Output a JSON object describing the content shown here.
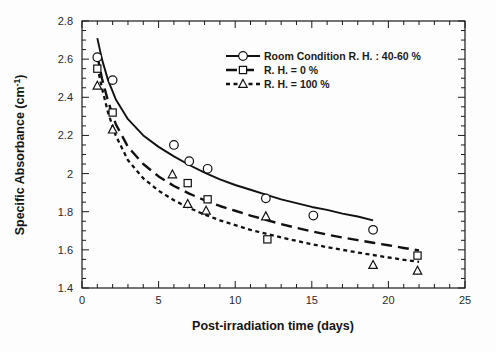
{
  "chart_data": {
    "type": "scatter",
    "title": "",
    "xlabel": "Post-irradiation time (days)",
    "ylabel": "Specific Absorbance (cm-1)",
    "ylabel_main": "Specific Absorbance (cm",
    "ylabel_sup": "-1",
    "ylabel_tail": ")",
    "xlim": [
      0,
      25
    ],
    "ylim": [
      1.4,
      2.8
    ],
    "xticks": [
      0,
      5,
      10,
      15,
      20,
      25
    ],
    "xtick_labels": [
      "0",
      "5",
      "10",
      "15",
      "20",
      "25"
    ],
    "xminor_step": 1,
    "yticks": [
      1.4,
      1.6,
      1.8,
      2.0,
      2.2,
      2.4,
      2.6,
      2.8
    ],
    "ytick_labels": [
      "1.4",
      "1.6",
      "1.8",
      "2",
      "2.2",
      "2.4",
      "2.6",
      "2.8"
    ],
    "yminor_step": 0.05,
    "grid": false,
    "legend_position": "upper-center-right",
    "frame": true,
    "series": [
      {
        "name": "Room Condition R. H. : 40-60 %",
        "marker": "circle-open",
        "linestyle": "solid",
        "color": "#111111",
        "x": [
          1,
          2,
          6,
          7,
          8.2,
          12,
          15.1,
          19
        ],
        "y": [
          2.61,
          2.49,
          2.15,
          2.065,
          2.025,
          1.87,
          1.78,
          1.705
        ],
        "fit_x": [
          1,
          1.3,
          1.7,
          2.2,
          3,
          4,
          5,
          6,
          7,
          8,
          9,
          10,
          11,
          12,
          13,
          14,
          15,
          16,
          17,
          18,
          19
        ],
        "fit_y": [
          2.71,
          2.6,
          2.49,
          2.39,
          2.285,
          2.2,
          2.14,
          2.09,
          2.045,
          2.005,
          1.97,
          1.94,
          1.915,
          1.89,
          1.865,
          1.845,
          1.825,
          1.81,
          1.79,
          1.775,
          1.755
        ]
      },
      {
        "name": "R. H. = 0 %",
        "marker": "square-open",
        "linestyle": "long-dash",
        "color": "#111111",
        "x": [
          1,
          2,
          6.9,
          8.2,
          12.1,
          21.9
        ],
        "y": [
          2.55,
          2.32,
          1.95,
          1.865,
          1.655,
          1.57
        ],
        "fit_x": [
          1,
          1.3,
          1.7,
          2.2,
          3,
          4,
          5,
          6,
          7,
          8,
          9,
          10,
          11,
          12,
          13,
          14,
          15,
          16,
          17,
          18,
          19,
          20,
          21,
          22
        ],
        "fit_y": [
          2.62,
          2.5,
          2.38,
          2.26,
          2.14,
          2.05,
          1.985,
          1.935,
          1.895,
          1.86,
          1.83,
          1.805,
          1.78,
          1.757,
          1.735,
          1.715,
          1.697,
          1.68,
          1.665,
          1.651,
          1.637,
          1.624,
          1.61,
          1.597
        ]
      },
      {
        "name": "R. H. = 100 %",
        "marker": "triangle-open",
        "linestyle": "short-dash",
        "color": "#111111",
        "x": [
          1,
          2,
          5.9,
          6.9,
          8.1,
          12,
          19,
          21.9
        ],
        "y": [
          2.46,
          2.23,
          1.995,
          1.84,
          1.805,
          1.775,
          1.52,
          1.49
        ],
        "fit_x": [
          1,
          1.3,
          1.7,
          2.2,
          3,
          4,
          5,
          6,
          7,
          8,
          9,
          10,
          11,
          12,
          13,
          14,
          15,
          16,
          17,
          18,
          19,
          20,
          21,
          22
        ],
        "fit_y": [
          2.56,
          2.45,
          2.32,
          2.2,
          2.07,
          1.975,
          1.91,
          1.86,
          1.82,
          1.785,
          1.755,
          1.73,
          1.705,
          1.685,
          1.665,
          1.647,
          1.63,
          1.614,
          1.6,
          1.586,
          1.573,
          1.56,
          1.548,
          1.537
        ]
      }
    ]
  },
  "legend": {
    "items": [
      {
        "label": "Room Condition R. H. : 40-60 %",
        "marker": "circle-open",
        "linestyle": "solid"
      },
      {
        "label": "R. H. = 0 %",
        "marker": "square-open",
        "linestyle": "long-dash"
      },
      {
        "label": "R. H. = 100 %",
        "marker": "triangle-open",
        "linestyle": "short-dash"
      }
    ]
  },
  "axes": {
    "x_title": "Post-irradiation time (days)",
    "y_title_main": "Specific Absorbance (cm",
    "y_title_sup": "-1",
    "y_title_tail": ")",
    "x_tick_labels": [
      "0",
      "5",
      "10",
      "15",
      "20",
      "25"
    ],
    "y_tick_labels": [
      "1.4",
      "1.6",
      "1.8",
      "2",
      "2.2",
      "2.4",
      "2.6",
      "2.8"
    ]
  },
  "colors": {
    "axis": "#1a1a1a",
    "series": "#111111",
    "background": "#fdfdfd"
  }
}
